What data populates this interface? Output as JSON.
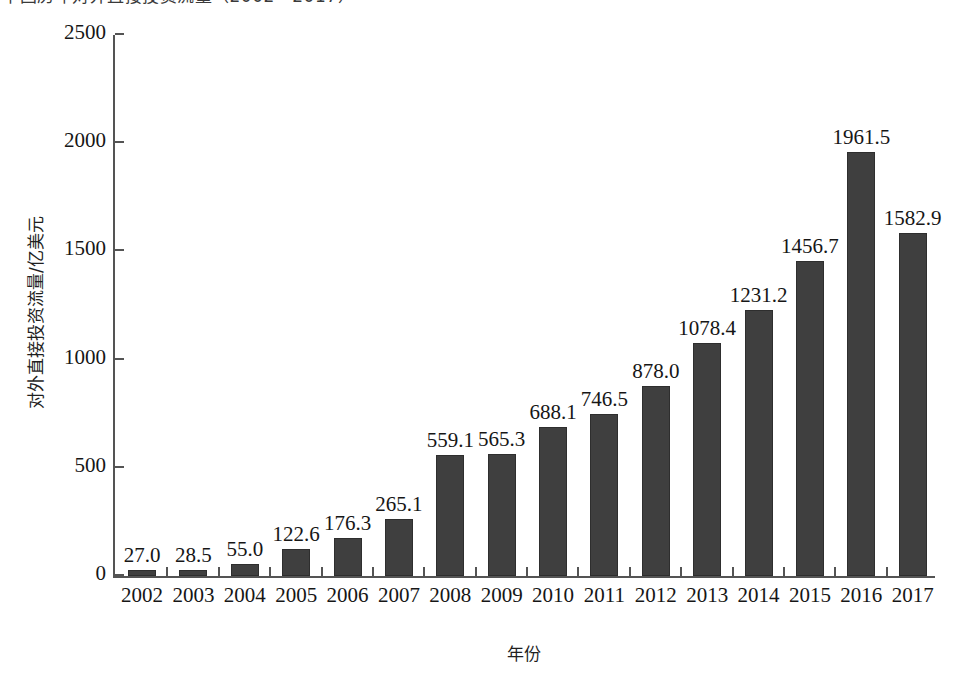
{
  "caption": {
    "text": "中国历年对外直接投资流量（2002—2017）",
    "note": "cut off at top edge of image"
  },
  "chart_data": {
    "type": "bar",
    "title": "",
    "xlabel": "年份",
    "ylabel": "对外直接投资流量/亿美元",
    "categories": [
      "2002",
      "2003",
      "2004",
      "2005",
      "2006",
      "2007",
      "2008",
      "2009",
      "2010",
      "2011",
      "2012",
      "2013",
      "2014",
      "2015",
      "2016",
      "2017"
    ],
    "values": [
      27.0,
      28.5,
      55.0,
      122.6,
      176.3,
      265.1,
      559.1,
      565.3,
      688.1,
      746.5,
      878.0,
      1078.4,
      1231.2,
      1456.7,
      1961.5,
      1582.9
    ],
    "value_labels": [
      "27.0",
      "28.5",
      "55.0",
      "122.6",
      "176.3",
      "265.1",
      "559.1",
      "565.3",
      "688.1",
      "746.5",
      "878.0",
      "1078.4",
      "1231.2",
      "1456.7",
      "1961.5",
      "1582.9"
    ],
    "ylim": [
      0,
      2500
    ],
    "yticks": [
      0,
      500,
      1000,
      1500,
      2000,
      2500
    ],
    "ytick_labels": [
      "0",
      "500",
      "1000",
      "1500",
      "2000",
      "2500"
    ],
    "grid": false,
    "legend": null,
    "bar_color": "#3f3f3f",
    "axis_color": "#545454",
    "background_color": "#ffffff"
  }
}
